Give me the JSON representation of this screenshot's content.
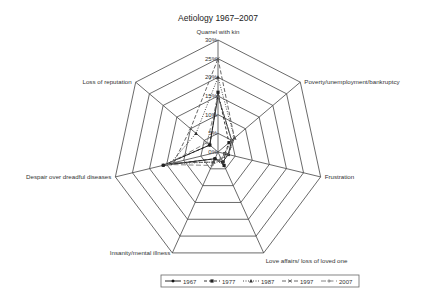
{
  "chart_data": {
    "type": "radar",
    "title": "Aetiology 1967–2007",
    "axes": [
      "Quarrel with kin",
      "Poverty/unemployment/bankruptcy",
      "Frustration",
      "Love affairs/ loss of loved one",
      "Insanity/mental illness",
      "Despair over dreadful diseases",
      "Loss of reputation"
    ],
    "ticks": [
      "0%",
      "5%",
      "10%",
      "15%",
      "20%",
      "25%",
      "30%"
    ],
    "range": [
      0,
      30
    ],
    "series": [
      {
        "name": "1967",
        "style": "solid-diamond",
        "values": [
          15,
          5,
          3,
          3,
          2,
          16,
          3
        ]
      },
      {
        "name": "1977",
        "style": "dash-square",
        "values": [
          16,
          4,
          2,
          4,
          2,
          16,
          3
        ]
      },
      {
        "name": "1987",
        "style": "dot-triangle",
        "values": [
          20,
          6,
          3,
          3,
          3,
          14,
          8
        ]
      },
      {
        "name": "1997",
        "style": "dash-x",
        "values": [
          25,
          6,
          3,
          2,
          3,
          13,
          10
        ]
      },
      {
        "name": "2007",
        "style": "longdash-plus",
        "values": [
          15,
          5,
          2,
          2,
          4,
          15,
          4
        ]
      }
    ],
    "legend_position": "bottom"
  }
}
